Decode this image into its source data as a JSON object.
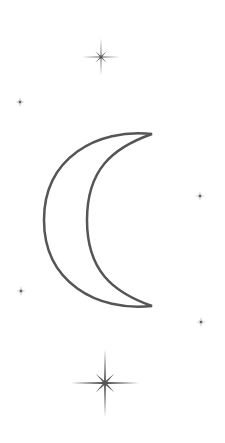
{
  "illustration": {
    "title": "Crescent moon with stars",
    "background": "#ffffff",
    "ink_color": "#555555",
    "moon": {
      "shape": "crescent",
      "opening": "right",
      "style": "outline",
      "top_tip": [
        152,
        134
      ],
      "bottom_tip": [
        152,
        306
      ],
      "outer_leftmost": [
        44,
        220
      ],
      "inner_leftmost": [
        87,
        220
      ],
      "stroke_width": 2.5
    },
    "stars": [
      {
        "name": "top-large-star",
        "cx": 101,
        "cy": 57,
        "size": "medium",
        "long_arm": 19,
        "short_arm": 8
      },
      {
        "name": "left-upper-small-star",
        "cx": 20,
        "cy": 102,
        "size": "small",
        "long_arm": 5,
        "short_arm": 2.5
      },
      {
        "name": "right-middle-small-star",
        "cx": 200,
        "cy": 196,
        "size": "small",
        "long_arm": 5,
        "short_arm": 2.5
      },
      {
        "name": "left-lower-small-star",
        "cx": 21,
        "cy": 291,
        "size": "small",
        "long_arm": 5,
        "short_arm": 2.5
      },
      {
        "name": "right-lower-small-star",
        "cx": 201,
        "cy": 322,
        "size": "small",
        "long_arm": 5,
        "short_arm": 2.5
      },
      {
        "name": "bottom-large-star",
        "cx": 105,
        "cy": 383,
        "size": "large",
        "long_arm": 34,
        "short_arm": 13
      }
    ]
  }
}
